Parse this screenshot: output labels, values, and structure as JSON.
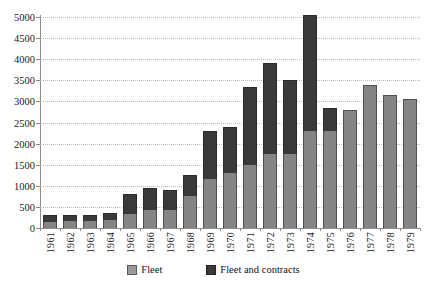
{
  "chart_data": {
    "type": "bar",
    "subtype": "stacked-column",
    "title": "",
    "xlabel": "",
    "ylabel": "",
    "ylim": [
      0,
      5000
    ],
    "ytick_step": 500,
    "yticks": [
      "0",
      "500",
      "1000",
      "1500",
      "2000",
      "2500",
      "3000",
      "3500",
      "4000",
      "4500",
      "5000"
    ],
    "grid": true,
    "legend_position": "bottom",
    "categories": [
      "1961",
      "1962",
      "1963",
      "1964",
      "1965",
      "1966",
      "1967",
      "1968",
      "1969",
      "1970",
      "1971",
      "1972",
      "1973",
      "1974",
      "1975",
      "1976",
      "1977",
      "1978",
      "1979"
    ],
    "series": [
      {
        "name": "Fleet",
        "color": "#848484",
        "values": [
          150,
          160,
          160,
          190,
          330,
          420,
          420,
          760,
          1170,
          1300,
          1500,
          1750,
          1750,
          2300,
          2300,
          2800,
          3400,
          3150,
          3050
        ]
      },
      {
        "name": "Fleet and contracts",
        "color": "#3a3a3a",
        "values": [
          150,
          140,
          140,
          160,
          470,
          530,
          480,
          490,
          1130,
          1100,
          1850,
          2150,
          1750,
          2750,
          550,
          0,
          0,
          0,
          0
        ]
      }
    ],
    "totals": [
      300,
      300,
      300,
      350,
      800,
      950,
      900,
      1250,
      2300,
      2400,
      3350,
      3900,
      3500,
      5050,
      2850,
      2800,
      3400,
      3150,
      3050
    ]
  },
  "legend": {
    "items": [
      {
        "label": "Fleet",
        "swatch": "fleet-swatch"
      },
      {
        "label": "Fleet and contracts",
        "swatch": "contracts-swatch"
      }
    ]
  },
  "colors": {
    "fleet": "#848484",
    "contracts": "#3a3a3a",
    "axis": "#8d8d8d",
    "grid": "#b9b9b9",
    "background": "#ffffff"
  }
}
